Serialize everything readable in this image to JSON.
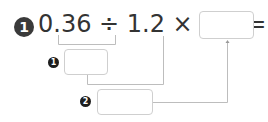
{
  "problem": {
    "number": "1",
    "expression": "0.36 ÷ 1.2 × 2.8 =",
    "result_box_value": ""
  },
  "steps": [
    {
      "number": "1",
      "value": ""
    },
    {
      "number": "2",
      "value": ""
    }
  ],
  "colors": {
    "text": "#333333",
    "badge": "#3a3a3a",
    "line": "#bdbdbd",
    "box_border": "#cfcfcf"
  }
}
